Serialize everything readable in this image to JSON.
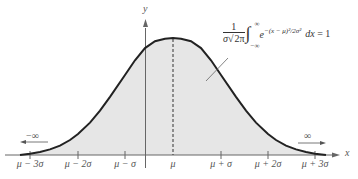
{
  "diagram": {
    "axes": {
      "x_label": "x",
      "y_label": "y"
    },
    "x_tick_labels": [
      "μ − 3σ",
      "μ − 2σ",
      "μ − σ",
      "μ",
      "μ + σ",
      "μ + 2σ",
      "μ + 3σ"
    ],
    "tails": {
      "left": "−∞",
      "right": "∞"
    },
    "formula": {
      "numerator": "1",
      "denominator_sigma": "σ",
      "denominator_sqrt": "2π",
      "upper_limit": "∞",
      "lower_limit": "−∞",
      "integrand_base": "e",
      "integrand_exponent": "−(x − μ)²/2σ²",
      "differential": "dx",
      "equals": "= 1",
      "full_text": "1/(σ√(2π)) ∫_{−∞}^{∞} e^{−(x − μ)²/2σ²} dx = 1"
    },
    "annotations": {
      "mean_line": "dashed vertical line at μ",
      "shaded_region": "entire area under the curve (light gray)"
    },
    "colors": {
      "curve": "#222222",
      "fill": "#e6e6e6",
      "axis": "#666666",
      "text": "#555555"
    }
  }
}
